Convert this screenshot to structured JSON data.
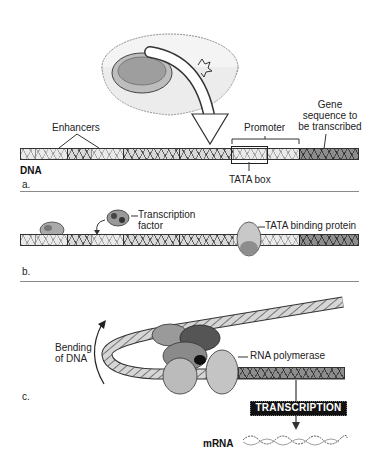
{
  "panels": {
    "a": {
      "panel_label": "a.",
      "strand_label": "DNA",
      "labels": {
        "enhancers": "Enhancers",
        "promoter": "Promoter",
        "gene_line1": "Gene",
        "gene_line2": "sequence to",
        "gene_line3": "be transcribed",
        "tata_box": "TATA box"
      }
    },
    "b": {
      "panel_label": "b.",
      "labels": {
        "tf_line1": "Transcription",
        "tf_line2": "factor",
        "tbp": "TATA binding protein"
      }
    },
    "c": {
      "panel_label": "c.",
      "labels": {
        "bending_line1": "Bending",
        "bending_line2": "of DNA",
        "rna_polymerase": "RNA polymerase",
        "transcription": "TRANSCRIPTION",
        "mrna": "mRNA"
      }
    }
  },
  "colors": {
    "ink": "#1a1a1a",
    "strand_fill": "#d9d9d9",
    "divider": "#8a8a8a",
    "transcription_box": "#111111"
  }
}
